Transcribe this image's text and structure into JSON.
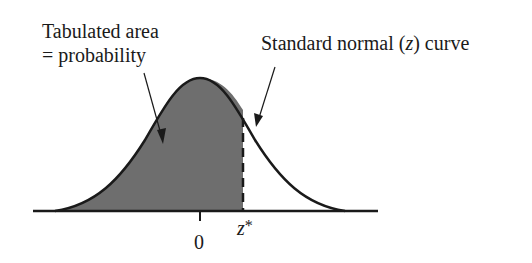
{
  "figure": {
    "annotations": {
      "tabulated_area_line1": "Tabulated area",
      "tabulated_area_line2": "= probability",
      "curve_label_prefix": "Standard normal (",
      "curve_label_var": "z",
      "curve_label_suffix": ") curve"
    },
    "axis": {
      "tick_zero": "0",
      "z_star_var": "z",
      "z_star_mark": "*"
    },
    "colors": {
      "shaded_area": "#6e6e6e",
      "curve": "#1a1a1a",
      "background": "#ffffff"
    }
  }
}
